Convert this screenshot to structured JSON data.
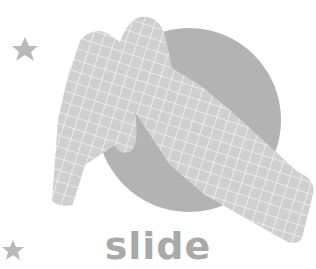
{
  "illustration": {
    "caption": "slide",
    "icons": [
      "star-icon",
      "star-icon",
      "slide-illustration"
    ],
    "colors": {
      "circle": "#b3b3b3",
      "slide": "#cfcfcf",
      "grid": "#f2f2f2",
      "star": "#b9b9b9",
      "caption": "#a9a9a9"
    }
  }
}
